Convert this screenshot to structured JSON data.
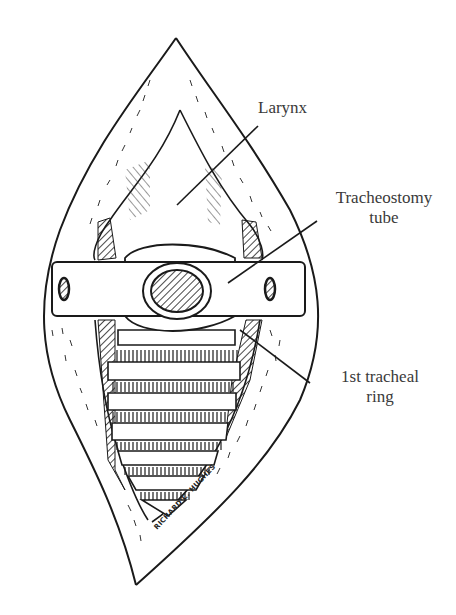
{
  "figure": {
    "type": "medical-illustration",
    "labels": {
      "larynx": "Larynx",
      "tracheostomy_tube_line1": "Tracheostomy",
      "tracheostomy_tube_line2": "tube",
      "first_tracheal_ring_line1": "1st tracheal",
      "first_tracheal_ring_line2": "ring"
    },
    "signature": "RICHARD C. HUGHES",
    "colors": {
      "ink": "#1a1a1a",
      "label_text": "#3a3a3a",
      "background": "#ffffff"
    }
  }
}
